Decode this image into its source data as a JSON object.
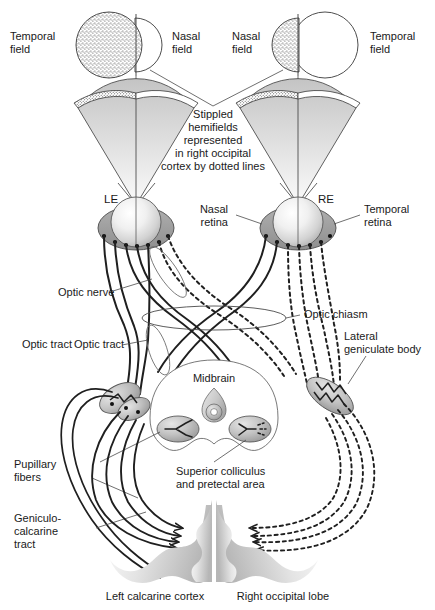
{
  "figure": {
    "type": "anatomical-diagram"
  },
  "fields": {
    "left_temporal": "Temporal\nfield",
    "left_temporal_l1": "Temporal",
    "left_temporal_l2": "field",
    "left_nasal_l1": "Nasal",
    "left_nasal_l2": "field",
    "right_nasal_l1": "Nasal",
    "right_nasal_l2": "field",
    "right_temporal_l1": "Temporal",
    "right_temporal_l2": "field"
  },
  "caption": {
    "line1": "Stippled",
    "line2": "hemifields",
    "line3": "represented",
    "line4": "in right occipital",
    "line5": "cortex by dotted lines"
  },
  "eyes": {
    "left_label": "LE",
    "right_label": "RE",
    "nasal_retina_l1": "Nasal",
    "nasal_retina_l2": "retina",
    "temporal_retina_l1": "Temporal",
    "temporal_retina_l2": "retina"
  },
  "pathway": {
    "optic_nerve": "Optic nerve",
    "optic_chiasm": "Optic chiasm",
    "optic_tract": "Optic tract",
    "lateral_geniculate_l1": "Lateral",
    "lateral_geniculate_l2": "geniculate body",
    "pupillary_l1": "Pupillary",
    "pupillary_l2": "fibers",
    "geniculocalcarine_l1": "Geniculo-",
    "geniculocalcarine_l2": "calcarine",
    "geniculocalcarine_l3": "tract"
  },
  "brain": {
    "midbrain": "Midbrain",
    "colliculus_l1": "Superior colliculus",
    "colliculus_l2": "and pretectal area",
    "left_cortex": "Left calcarine cortex",
    "right_lobe": "Right occipital lobe"
  },
  "colors": {
    "ink": "#1a1a1a",
    "line": "#2b2b2b",
    "stipple": "#555555",
    "tissue_light": "#f2f2f2",
    "tissue_mid": "#c9c9c9",
    "tissue_dark": "#9a9a9a",
    "background": "#ffffff"
  }
}
